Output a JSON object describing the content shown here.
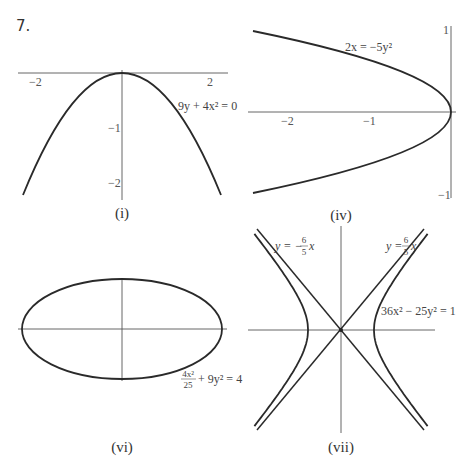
{
  "problem_number": "7.",
  "panels": [
    {
      "id": "i",
      "caption": "(i)",
      "equation": "9y + 4x² = 0",
      "x_ticks": [
        "−2",
        "2"
      ],
      "y_ticks": [
        "−1",
        "−2"
      ]
    },
    {
      "id": "iv",
      "caption": "(iv)",
      "equation": "2x = −5y²",
      "x_ticks": [
        "−2",
        "−1"
      ],
      "y_ticks": [
        "1",
        "−1"
      ]
    },
    {
      "id": "vi",
      "caption": "(vi)",
      "equation": "4x²/25 + 9y² = 4",
      "equation_num": "4x²",
      "equation_den": "25",
      "equation_rest": "+ 9y² = 4"
    },
    {
      "id": "vii",
      "caption": "(vii)",
      "equation": "36x² − 25y² = 1",
      "asymptote_left": "y = −(6/5)x",
      "asymptote_right": "y = (6/5)x",
      "asym_left_prefix": "y = −",
      "asym_right_prefix": "y = ",
      "asym_frac_num": "6",
      "asym_frac_den": "5",
      "asym_suffix": "x"
    }
  ],
  "chart_data": [
    {
      "type": "line",
      "title": "(i)",
      "equation": "9y + 4x^2 = 0",
      "x": [
        -2.2,
        -2,
        -1.5,
        -1,
        -0.5,
        0,
        0.5,
        1,
        1.5,
        2,
        2.2
      ],
      "y": [
        -2.15,
        -1.78,
        -1.0,
        -0.44,
        -0.11,
        0,
        -0.11,
        -0.44,
        -1.0,
        -1.78,
        -2.15
      ],
      "xticks": [
        -2,
        2
      ],
      "yticks": [
        -1,
        -2
      ],
      "xlim": [
        -2.4,
        2.4
      ],
      "ylim": [
        -2.3,
        0.1
      ]
    },
    {
      "type": "line",
      "title": "(iv)",
      "equation": "2x = -5y^2",
      "x": [
        -2.4,
        -1.6,
        -0.9,
        -0.4,
        -0.1,
        0,
        -0.1,
        -0.4,
        -0.9,
        -1.6,
        -2.4
      ],
      "y": [
        0.98,
        0.8,
        0.6,
        0.4,
        0.2,
        0,
        -0.2,
        -0.4,
        -0.6,
        -0.8,
        -0.98
      ],
      "xticks": [
        -2,
        -1
      ],
      "yticks": [
        1,
        -1
      ],
      "xlim": [
        -2.5,
        0.05
      ],
      "ylim": [
        -1,
        1
      ]
    },
    {
      "type": "line",
      "title": "(vi)",
      "equation": "4x^2/25 + 9y^2 = 4",
      "shape": "ellipse",
      "semi_major_x": 5,
      "semi_minor_y": 0.667
    },
    {
      "type": "line",
      "title": "(vii)",
      "equation": "36x^2 - 25y^2 = 1",
      "shape": "hyperbola",
      "vertices_x": [
        -0.1667,
        0.1667
      ],
      "asymptotes": [
        "y = -6/5 x",
        "y = 6/5 x"
      ]
    }
  ]
}
